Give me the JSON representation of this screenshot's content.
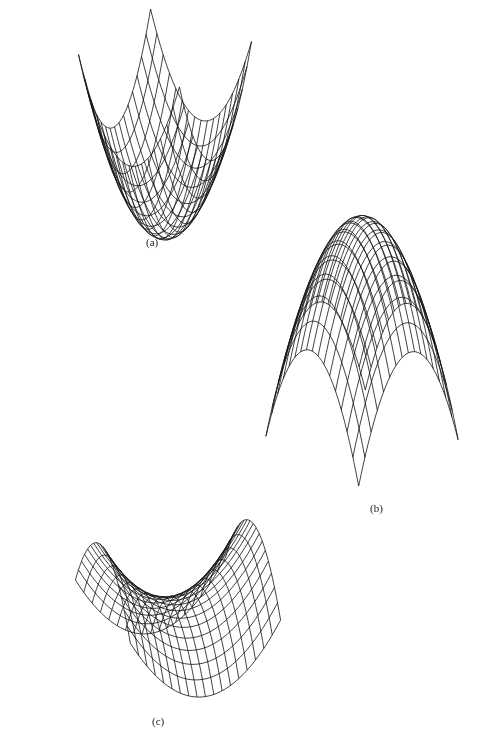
{
  "figure": {
    "panels": [
      {
        "id": "a",
        "label": "(a)",
        "surface": "paraboloid-up",
        "equation": "z = x^2 + y^2",
        "label_pos": [
          146,
          236
        ],
        "view": {
          "cx": 165,
          "cy": 238,
          "scale": 62,
          "zscale": 95,
          "rot": 0.62,
          "tilt": 0.45
        },
        "grid": 16,
        "range": [
          -1,
          1
        ],
        "sign": 1,
        "type": "paraboloid"
      },
      {
        "id": "b",
        "label": "(b)",
        "surface": "paraboloid-down",
        "equation": "z = -(x^2 + y^2)",
        "label_pos": [
          370,
          502
        ],
        "view": {
          "cx": 362,
          "cy": 350,
          "scale": 68,
          "zscale": 110,
          "rot": 0.82,
          "tilt": 0.5
        },
        "grid": 16,
        "range": [
          -1,
          1
        ],
        "sign": -1,
        "type": "paraboloid"
      },
      {
        "id": "c",
        "label": "(c)",
        "surface": "saddle",
        "equation": "z = x^2 - y^2",
        "label_pos": [
          152,
          715
        ],
        "view": {
          "cx": 178,
          "cy": 600,
          "scale": 80,
          "zscale": 65,
          "rot": -0.35,
          "tilt": 0.42
        },
        "grid": 18,
        "range": [
          -1,
          1
        ],
        "sign": 1,
        "type": "saddle"
      }
    ],
    "line_color": "#111111",
    "background": "#ffffff"
  }
}
